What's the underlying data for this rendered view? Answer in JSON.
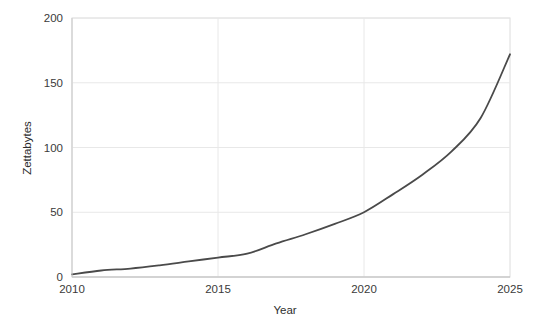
{
  "chart_data": {
    "type": "line",
    "title": "",
    "xlabel": "Year",
    "ylabel": "Zettabytes",
    "x": [
      2010,
      2011,
      2012,
      2013,
      2014,
      2015,
      2016,
      2017,
      2018,
      2019,
      2020,
      2021,
      2022,
      2023,
      2024,
      2025
    ],
    "values": [
      2,
      5,
      6.5,
      9,
      12,
      15,
      18,
      26,
      33,
      41,
      50,
      64,
      79,
      97,
      123,
      172
    ],
    "series": [
      {
        "name": "Global data volume",
        "values": [
          2,
          5,
          6.5,
          9,
          12,
          15,
          18,
          26,
          33,
          41,
          50,
          64,
          79,
          97,
          123,
          172
        ]
      }
    ],
    "xlim": [
      2010,
      2025
    ],
    "ylim": [
      0,
      200
    ],
    "xticks": [
      2010,
      2015,
      2020,
      2025
    ],
    "yticks": [
      0,
      50,
      100,
      150,
      200
    ],
    "xtick_labels": [
      "2010",
      "2015",
      "2020",
      "2025"
    ],
    "ytick_labels": [
      "0",
      "50",
      "100",
      "150",
      "200"
    ],
    "grid": true,
    "legend": false,
    "legend_position": "none",
    "line_color": "#4a4a4a",
    "grid_color": "#e8e8e8",
    "frame_color": "#dcdcdc",
    "background_color": "#ffffff"
  },
  "axes": {
    "y_title": "Zettabytes",
    "x_title": "Year",
    "y_ticks": [
      {
        "label": "200"
      },
      {
        "label": "150"
      },
      {
        "label": "100"
      },
      {
        "label": "50"
      },
      {
        "label": "0"
      }
    ],
    "x_ticks": [
      {
        "label": "2010"
      },
      {
        "label": "2015"
      },
      {
        "label": "2020"
      },
      {
        "label": "2025"
      }
    ]
  }
}
